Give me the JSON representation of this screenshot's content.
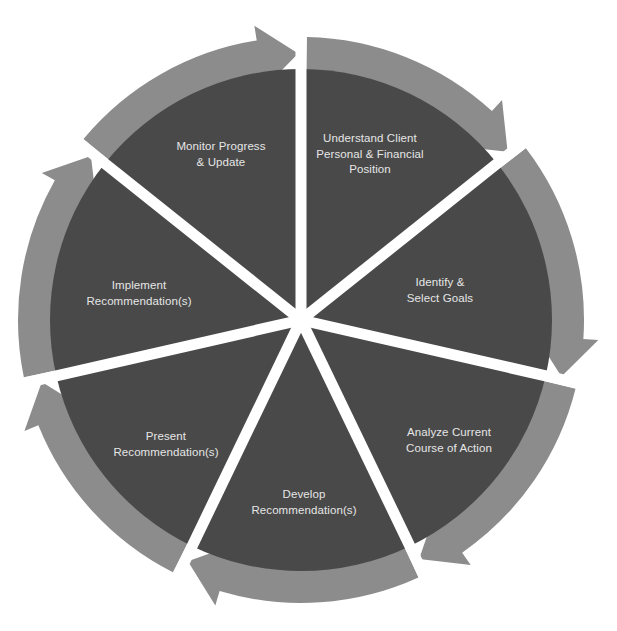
{
  "diagram": {
    "type": "cycle",
    "colors": {
      "background": "#ffffff",
      "segment_fill": "#494949",
      "arrow_fill": "#8c8c8c",
      "divider": "#ffffff",
      "label_text": "#e6e6e6"
    },
    "steps": [
      {
        "id": 1,
        "lines": [
          "Understand Client",
          "Personal & Financial",
          "Position"
        ],
        "label_pos": [
          370,
          154
        ]
      },
      {
        "id": 2,
        "lines": [
          "Identify &",
          "Select Goals"
        ],
        "label_pos": [
          440,
          290
        ]
      },
      {
        "id": 3,
        "lines": [
          "Analyze Current",
          "Course of Action"
        ],
        "label_pos": [
          449,
          440
        ]
      },
      {
        "id": 4,
        "lines": [
          "Develop",
          "Recommendation(s)"
        ],
        "label_pos": [
          304,
          502
        ]
      },
      {
        "id": 5,
        "lines": [
          "Present",
          "Recommendation(s)"
        ],
        "label_pos": [
          166,
          444
        ]
      },
      {
        "id": 6,
        "lines": [
          "Implement",
          "Recommendation(s)"
        ],
        "label_pos": [
          139,
          293
        ]
      },
      {
        "id": 7,
        "lines": [
          "Monitor Progress",
          "& Update"
        ],
        "label_pos": [
          221,
          154
        ]
      }
    ],
    "flow_direction": "clockwise"
  }
}
